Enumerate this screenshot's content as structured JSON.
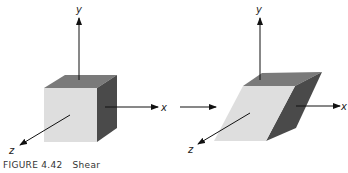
{
  "figure": {
    "caption_number": "FIGURE 4.42",
    "caption_title": "Shear",
    "colors": {
      "front_face": "#dedede",
      "top_face": "#7a7a7a",
      "side_face": "#4a4a4a",
      "axis": "#111111"
    },
    "left_panel": {
      "name": "original-cube",
      "axes": {
        "x": "x",
        "y": "y",
        "z": "z"
      }
    },
    "transform_arrow": "right-arrow",
    "right_panel": {
      "name": "sheared-cube",
      "axes": {
        "x": "x",
        "y": "y",
        "z": "z"
      }
    }
  }
}
